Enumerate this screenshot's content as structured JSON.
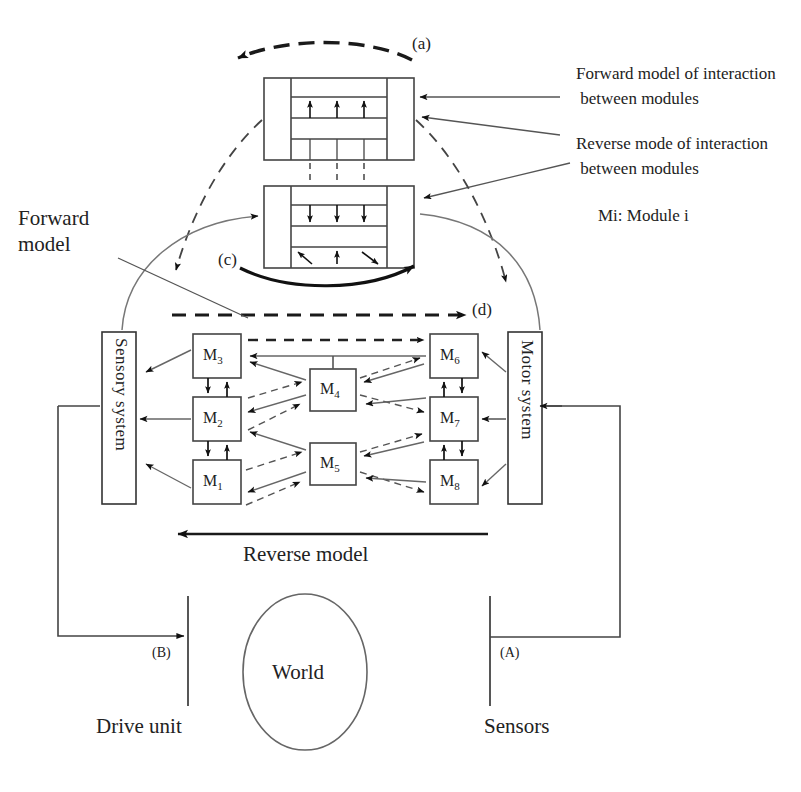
{
  "figure": {
    "legend": {
      "forward_interaction": "Forward model of interaction\n between modules",
      "reverse_interaction": "Reverse mode of interaction\n between modules",
      "module_key": "Mi: Module i"
    },
    "labels": {
      "forward_model": "Forward\nmodel",
      "reverse_model": "Reverse model",
      "world": "World",
      "drive_unit": "Drive unit",
      "sensors": "Sensors",
      "sensory_system": "Sensory system",
      "motor_system": "Motor system"
    },
    "tags": {
      "a": "(a)",
      "c": "(c)",
      "d": "(d)",
      "A": "(A)",
      "B": "(B)"
    },
    "modules": [
      {
        "id": "M1",
        "base": "M",
        "sub": "1",
        "x": 193,
        "y": 460,
        "w": 48,
        "h": 44
      },
      {
        "id": "M2",
        "base": "M",
        "sub": "2",
        "x": 193,
        "y": 397,
        "w": 48,
        "h": 44
      },
      {
        "id": "M3",
        "base": "M",
        "sub": "3",
        "x": 193,
        "y": 334,
        "w": 48,
        "h": 44
      },
      {
        "id": "M4",
        "base": "M",
        "sub": "4",
        "x": 310,
        "y": 369,
        "w": 46,
        "h": 42
      },
      {
        "id": "M5",
        "base": "M",
        "sub": "5",
        "x": 310,
        "y": 443,
        "w": 46,
        "h": 42
      },
      {
        "id": "M6",
        "base": "M",
        "sub": "6",
        "x": 430,
        "y": 334,
        "w": 48,
        "h": 44
      },
      {
        "id": "M7",
        "base": "M",
        "sub": "7",
        "x": 430,
        "y": 397,
        "w": 48,
        "h": 44
      },
      {
        "id": "M8",
        "base": "M",
        "sub": "8",
        "x": 430,
        "y": 460,
        "w": 48,
        "h": 44
      }
    ],
    "stacks": [
      {
        "name": "forward-interaction-stack",
        "x": 264,
        "y": 78,
        "w": 150,
        "h": 82
      },
      {
        "name": "reverse-interaction-stack",
        "x": 264,
        "y": 186,
        "w": 150,
        "h": 82
      }
    ],
    "blocks": {
      "sensory_system": {
        "x": 102,
        "y": 332,
        "w": 34,
        "h": 172
      },
      "motor_system": {
        "x": 508,
        "y": 332,
        "w": 34,
        "h": 172
      },
      "world": {
        "cx": 305,
        "cy": 672,
        "rx": 62,
        "ry": 78
      }
    },
    "colors": {
      "ink": "#1a1a1a",
      "line": "#555555",
      "dashed": "#333333",
      "background": "#ffffff"
    }
  }
}
